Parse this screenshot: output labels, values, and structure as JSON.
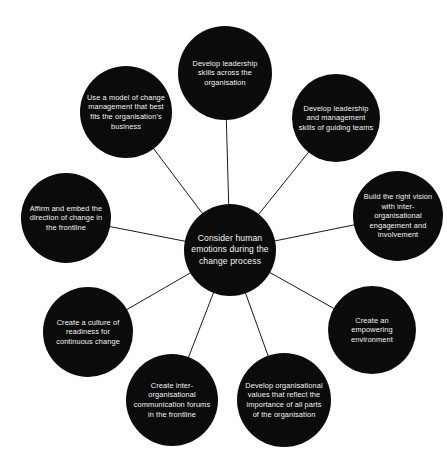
{
  "diagram": {
    "type": "radial-hub-and-spoke",
    "title": "Consider human emotions during the change process",
    "background_color": "#ffffff",
    "node_color": "#0b0b0b",
    "node_text_color": "#f2f2f2",
    "edge_color": "#1a1a1a",
    "edge_width": 1,
    "canvas": {
      "width": 447,
      "height": 467
    },
    "hub": {
      "id": "hub",
      "label": "Consider human emotions during the change process",
      "cx": 230,
      "cy": 250,
      "r": 46,
      "font_size": 8.6,
      "line_height": 11.2
    },
    "satellites": [
      {
        "id": "develop-leadership-skills",
        "label": "Develop leadership skills across the organisation",
        "cx": 225,
        "cy": 73,
        "r": 47,
        "font_size": 7.4,
        "line_height": 9.6
      },
      {
        "id": "develop-leadership-management-skills",
        "label": "Develop leadership and management skills of guiding teams",
        "cx": 336,
        "cy": 118,
        "r": 44,
        "font_size": 7.4,
        "line_height": 9.6
      },
      {
        "id": "build-right-vision",
        "label": "Build the right vision with inter-organisational engagement and involvement",
        "cx": 398,
        "cy": 216,
        "r": 45,
        "font_size": 7.4,
        "line_height": 9.6
      },
      {
        "id": "create-empowering-environment",
        "label": "Create an empowering environment",
        "cx": 372,
        "cy": 330,
        "r": 44,
        "font_size": 7.4,
        "line_height": 9.6
      },
      {
        "id": "develop-organisational-values",
        "label": "Develop organisational values that reflect the importance of all parts of the organisation",
        "cx": 284,
        "cy": 400,
        "r": 47,
        "font_size": 7.4,
        "line_height": 9.6
      },
      {
        "id": "create-communication-forums",
        "label": "Create inter-organisational communication forums in the frontline",
        "cx": 172,
        "cy": 400,
        "r": 46,
        "font_size": 7.4,
        "line_height": 9.6
      },
      {
        "id": "create-culture-of-readiness",
        "label": "Create a culture of readiness for continuous change",
        "cx": 88,
        "cy": 332,
        "r": 45,
        "font_size": 7.4,
        "line_height": 9.6
      },
      {
        "id": "affirm-embed-direction",
        "label": "Affirm and embed the direction of change in the frontline",
        "cx": 66,
        "cy": 218,
        "r": 45,
        "font_size": 7.4,
        "line_height": 9.6
      },
      {
        "id": "use-model-of-change-management",
        "label": "Use a model of change management that best fits the organisation's business",
        "cx": 126,
        "cy": 112,
        "r": 46,
        "font_size": 7.4,
        "line_height": 9.6
      }
    ],
    "edges": [
      {
        "from": "hub",
        "to": "develop-leadership-skills"
      },
      {
        "from": "hub",
        "to": "develop-leadership-management-skills"
      },
      {
        "from": "hub",
        "to": "build-right-vision"
      },
      {
        "from": "hub",
        "to": "create-empowering-environment"
      },
      {
        "from": "hub",
        "to": "develop-organisational-values"
      },
      {
        "from": "hub",
        "to": "create-communication-forums"
      },
      {
        "from": "hub",
        "to": "create-culture-of-readiness"
      },
      {
        "from": "hub",
        "to": "affirm-embed-direction"
      },
      {
        "from": "hub",
        "to": "use-model-of-change-management"
      }
    ]
  }
}
